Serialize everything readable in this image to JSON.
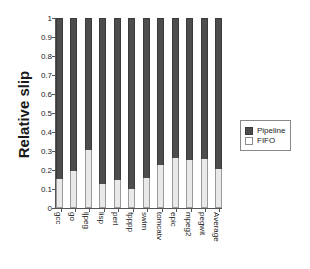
{
  "chart_data": {
    "type": "bar",
    "stacked": true,
    "title": "",
    "xlabel": "",
    "ylabel": "Relative slip",
    "ylim": [
      0,
      1
    ],
    "yticks": [
      "0",
      "0.1",
      "0.2",
      "0.3",
      "0.4",
      "0.5",
      "0.6",
      "0.7",
      "0.8",
      "0.9",
      "1"
    ],
    "ytick_values": [
      0,
      0.1,
      0.2,
      0.3,
      0.4,
      0.5,
      0.6,
      0.7,
      0.8,
      0.9,
      1.0
    ],
    "grid": false,
    "legend_position": "right",
    "categories": [
      "gcc",
      "go",
      "ijpeg",
      "lisp",
      "perl",
      "fpppp",
      "swim",
      "tomcatv",
      "epic",
      "mpeg2",
      "pegwit",
      "Average"
    ],
    "series": [
      {
        "name": "Pipeline",
        "color": "#4d4d4d",
        "values": [
          0.845,
          0.805,
          0.695,
          0.875,
          0.855,
          0.9,
          0.84,
          0.775,
          0.735,
          0.745,
          0.74,
          0.795
        ]
      },
      {
        "name": "FIFO",
        "color": "#e9e9e9",
        "values": [
          0.155,
          0.195,
          0.305,
          0.125,
          0.145,
          0.1,
          0.16,
          0.225,
          0.265,
          0.255,
          0.26,
          0.205
        ]
      }
    ]
  },
  "axis": {
    "y_title": "Relative slip"
  },
  "legend": {
    "entries": [
      {
        "label": "Pipeline",
        "swatch": "pipeline-swatch"
      },
      {
        "label": "FIFO",
        "swatch": "fifo-swatch"
      }
    ]
  }
}
